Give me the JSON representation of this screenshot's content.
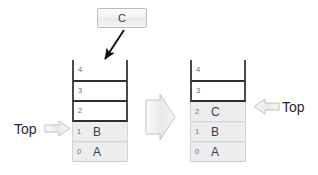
{
  "diagram": {
    "title_element": {
      "label": "C"
    },
    "left_stack": {
      "name": "stack-before-push",
      "cells": [
        {
          "index": "4",
          "value": "",
          "state": "open"
        },
        {
          "index": "3",
          "value": "",
          "state": "frame"
        },
        {
          "index": "2",
          "value": "",
          "state": "frame"
        },
        {
          "index": "1",
          "value": "B",
          "state": "filled"
        },
        {
          "index": "0",
          "value": "A",
          "state": "filled"
        }
      ],
      "top_pointer_index": "1"
    },
    "right_stack": {
      "name": "stack-after-push",
      "cells": [
        {
          "index": "4",
          "value": "",
          "state": "open"
        },
        {
          "index": "3",
          "value": "",
          "state": "frame"
        },
        {
          "index": "2",
          "value": "C",
          "state": "filled"
        },
        {
          "index": "1",
          "value": "B",
          "state": "filled"
        },
        {
          "index": "0",
          "value": "A",
          "state": "filled"
        }
      ],
      "top_pointer_index": "2"
    },
    "labels": {
      "top_left": "Top",
      "top_right": "Top"
    },
    "icons": {
      "push_arrow": "diagonal-arrow-down-left-icon",
      "transition_arrow": "block-arrow-right-icon",
      "top_pointer_left": "block-arrow-right-icon",
      "top_pointer_right": "block-arrow-left-icon"
    },
    "colors": {
      "cell_border_strong": "#2f2f2f",
      "cell_fill": "#ededef",
      "arrow_gray": "#d9d9db",
      "arrow_outline": "#b3b3b5",
      "text": "#3d3d3d",
      "index_text": "#6f7072"
    }
  }
}
